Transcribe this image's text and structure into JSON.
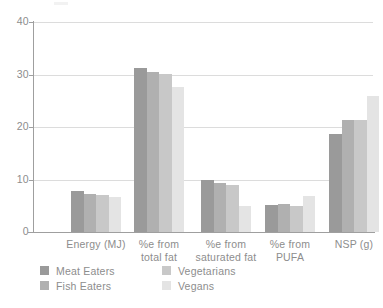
{
  "chart_data": {
    "type": "bar",
    "title": "",
    "subtitle": "",
    "xlabel": "",
    "ylabel": "",
    "ylim": [
      0,
      40
    ],
    "yticks": [
      0,
      10,
      20,
      30,
      40
    ],
    "ytick_labels": [
      "0",
      "10",
      "20",
      "30",
      "40"
    ],
    "grid": true,
    "grid_axis": "y",
    "legend_position": "bottom",
    "categories": [
      "Energy (MJ)",
      "%e from total fat",
      "%e from saturated fat",
      "%e from PUFA",
      "NSP (g)"
    ],
    "category_lines": [
      [
        "Energy (MJ)"
      ],
      [
        "%e from",
        "total fat"
      ],
      [
        "%e from",
        "saturated fat"
      ],
      [
        "%e from",
        "PUFA"
      ],
      [
        "NSP (g)"
      ]
    ],
    "series": [
      {
        "name": "Meat Eaters",
        "color": "#9a9a9a",
        "values": [
          7.8,
          31.2,
          10.0,
          5.2,
          18.7
        ]
      },
      {
        "name": "Fish Eaters",
        "color": "#b0b0b0",
        "values": [
          7.3,
          30.5,
          9.3,
          5.4,
          21.4
        ]
      },
      {
        "name": "Vegetarians",
        "color": "#c8c8c8",
        "values": [
          7.1,
          30.1,
          8.9,
          5.0,
          21.4
        ]
      },
      {
        "name": "Vegans",
        "color": "#e4e4e4",
        "values": [
          6.6,
          27.6,
          5.0,
          6.9,
          26.0
        ]
      }
    ]
  },
  "legend": {
    "entries": [
      {
        "label": "Meat Eaters",
        "color": "#9a9a9a"
      },
      {
        "label": "Fish Eaters",
        "color": "#b0b0b0"
      },
      {
        "label": "Vegetarians",
        "color": "#c8c8c8"
      },
      {
        "label": "Vegans",
        "color": "#e4e4e4"
      }
    ]
  },
  "axis": {
    "y_tick_labels": [
      "40",
      "30",
      "20",
      "10",
      "0"
    ]
  },
  "colors": {
    "axis_line": "#9f9f9f",
    "gridline": "#dcdcdc",
    "text": "#8d8d8d",
    "background": "#ffffff"
  }
}
